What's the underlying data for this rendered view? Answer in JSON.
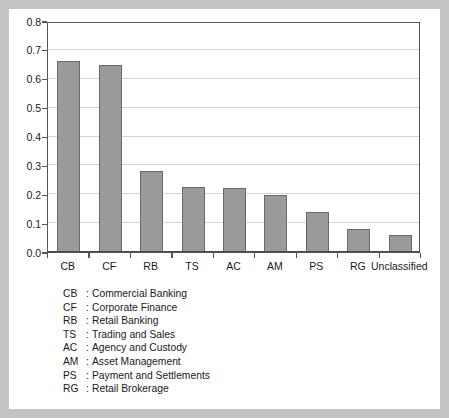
{
  "chart_data": {
    "type": "bar",
    "title": "",
    "subtitle": "",
    "xlabel": "",
    "ylabel": "",
    "categories": [
      "CB",
      "CF",
      "RB",
      "TS",
      "AC",
      "AM",
      "PS",
      "RG",
      "Unclassified"
    ],
    "values": [
      0.662,
      0.646,
      0.281,
      0.226,
      0.222,
      0.196,
      0.139,
      0.08,
      0.058
    ],
    "ylim": [
      0.0,
      0.8
    ],
    "ytick_labels": [
      "0.0",
      "0.1",
      "0.2",
      "0.3",
      "0.4",
      "0.5",
      "0.6",
      "0.7",
      "0.8"
    ],
    "ytick_values": [
      0.0,
      0.1,
      0.2,
      0.3,
      0.4,
      0.5,
      0.6,
      0.7,
      0.8
    ],
    "grid": true,
    "legend_position": "below-plot",
    "bar_color": "#9a9a9a",
    "bar_edge_color": "#6a6a6a",
    "gridline_color": "#d4d4d4",
    "axis_color": "#555555",
    "frame_color": "#c4c4c4",
    "background_color": "#ffffff"
  },
  "legend": {
    "entries": [
      {
        "abbr": "CB",
        "colon": ":",
        "description": "Commercial Banking"
      },
      {
        "abbr": "CF",
        "colon": ":",
        "description": "Corporate Finance"
      },
      {
        "abbr": "RB",
        "colon": ":",
        "description": "Retail Banking"
      },
      {
        "abbr": "TS",
        "colon": ":",
        "description": "Trading and Sales"
      },
      {
        "abbr": "AC",
        "colon": ":",
        "description": "Agency and Custody"
      },
      {
        "abbr": "AM",
        "colon": ":",
        "description": "Asset Management"
      },
      {
        "abbr": "PS",
        "colon": ":",
        "description": "Payment and Settlements"
      },
      {
        "abbr": "RG",
        "colon": ":",
        "description": "Retail Brokerage"
      }
    ]
  }
}
